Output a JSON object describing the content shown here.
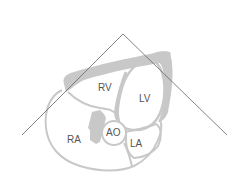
{
  "diagram": {
    "labels": {
      "rv": "RV",
      "lv": "LV",
      "ra": "RA",
      "ao": "AO",
      "la": "LA"
    },
    "colors": {
      "wall": "#c8c8c8",
      "outline": "#c8c8c8",
      "sector_line": "#666666",
      "label": "#555555",
      "background": "#ffffff"
    },
    "sector": {
      "apex": [
        123,
        34
      ],
      "left_end": [
        22,
        135
      ],
      "right_end": [
        227,
        135
      ]
    }
  }
}
